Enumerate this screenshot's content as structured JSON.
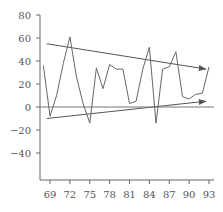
{
  "chart_data": {
    "type": "line",
    "title": "",
    "xlabel": "",
    "ylabel": "",
    "x": [
      68,
      69,
      70,
      71,
      72,
      73,
      74,
      75,
      76,
      77,
      78,
      79,
      80,
      81,
      82,
      83,
      84,
      85,
      86,
      87,
      88,
      89,
      90,
      91,
      92,
      93
    ],
    "series": [
      {
        "name": "series",
        "values": [
          36,
          -8,
          10,
          38,
          61,
          26,
          3,
          -14,
          34,
          16,
          37,
          33,
          33,
          3,
          5,
          33,
          52,
          -14,
          33,
          35,
          48,
          9,
          7,
          11,
          12,
          35
        ]
      }
    ],
    "annotations": [
      {
        "type": "arrow",
        "label": "upper trend line",
        "from": [
          68.5,
          55
        ],
        "to": [
          92.5,
          33
        ]
      },
      {
        "type": "arrow",
        "label": "lower trend line",
        "from": [
          68.5,
          -10
        ],
        "to": [
          92.5,
          5
        ]
      },
      {
        "type": "hline",
        "label": "zero line",
        "y": 0
      }
    ],
    "xticks": [
      "69",
      "72",
      "75",
      "78",
      "81",
      "84",
      "87",
      "90",
      "93"
    ],
    "yticks": [
      "80",
      "60",
      "40",
      "20",
      "0",
      "-20",
      "-40"
    ],
    "xlim": [
      67.5,
      94
    ],
    "ylim": [
      -60,
      80
    ],
    "grid": false,
    "legend": "none"
  }
}
